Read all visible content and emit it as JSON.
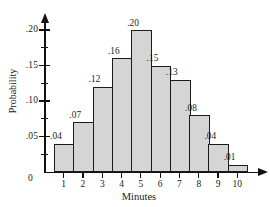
{
  "chart_data": {
    "type": "bar",
    "title": "",
    "xlabel": "Minutes",
    "ylabel": "Probability",
    "categories": [
      "1",
      "2",
      "3",
      "4",
      "5",
      "6",
      "7",
      "8",
      "9",
      "10"
    ],
    "values": [
      0.04,
      0.07,
      0.12,
      0.16,
      0.2,
      0.15,
      0.13,
      0.08,
      0.04,
      0.01
    ],
    "data_labels": [
      ".04",
      ".07",
      ".12",
      ".16",
      ".20",
      ".15",
      ".13",
      ".08",
      ".04",
      ".01"
    ],
    "ylim": [
      0,
      0.215
    ],
    "xlim": [
      0.5,
      10.5
    ],
    "y_major_ticks": [
      0.05,
      0.1,
      0.15,
      0.2
    ],
    "y_major_tick_labels": [
      ".05",
      ".10",
      ".15",
      ".20"
    ],
    "y_minor_ticks": [
      0.025,
      0.075,
      0.125,
      0.175
    ],
    "origin_label": "0",
    "grid": false,
    "legend": null,
    "bar_fill_color": "#d5d5d5",
    "bar_edge_color": "#1b1b1b",
    "axis_color": "#111111"
  }
}
